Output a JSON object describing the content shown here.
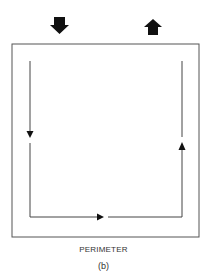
{
  "diagram": {
    "title": "PERIMETER",
    "label": "(b)",
    "colors": {
      "line": "#555555",
      "arrow": "#111111",
      "background": "#ffffff"
    },
    "entry_arrow": {
      "icon": "down-arrow-icon",
      "meaning": "in"
    },
    "exit_arrow": {
      "icon": "up-arrow-icon",
      "meaning": "out"
    },
    "path": {
      "directions": [
        "down",
        "right",
        "up"
      ]
    }
  }
}
